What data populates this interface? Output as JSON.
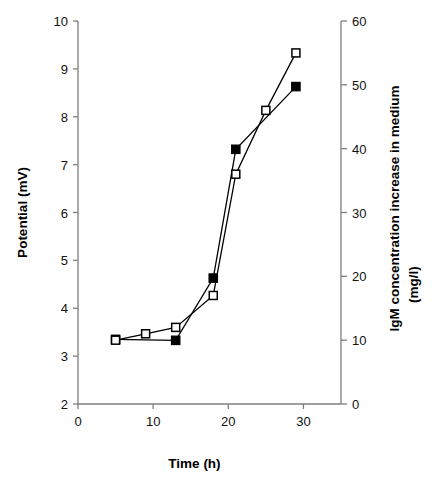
{
  "figure": {
    "background_color": "#ffffff",
    "line_color": "#000000",
    "axis_color": "#7f7f7f",
    "caption": ""
  },
  "chart_data": {
    "type": "line",
    "title": "",
    "xlabel": "Time (h)",
    "ylabel": "Potential (mV)",
    "y2label": "IgM concentration increase in medium (mg/l)",
    "y2label_line1": "IgM concentration increase in medium",
    "y2label_line2": "(mg/l)",
    "xlim": [
      0,
      35
    ],
    "ylim": [
      2,
      10
    ],
    "y2lim": [
      0,
      60
    ],
    "xticks": [
      0,
      10,
      20,
      30
    ],
    "xtick_labels": [
      "0",
      "10",
      "20",
      "30"
    ],
    "yticks": [
      2,
      3,
      4,
      5,
      6,
      7,
      8,
      9,
      10
    ],
    "ytick_labels": [
      "2",
      "3",
      "4",
      "5",
      "6",
      "7",
      "8",
      "9",
      "10"
    ],
    "y2ticks": [
      0,
      10,
      20,
      30,
      40,
      50,
      60
    ],
    "y2tick_labels": [
      "0",
      "10",
      "20",
      "30",
      "40",
      "50",
      "60"
    ],
    "grid": false,
    "legend": null,
    "series": [
      {
        "name": "Potential",
        "axis": "left",
        "marker": "filled-square",
        "unit": "mV",
        "x": [
          5,
          13,
          18,
          21,
          29
        ],
        "values": [
          3.35,
          3.33,
          4.63,
          7.32,
          8.63
        ]
      },
      {
        "name": "IgM concentration increase in medium",
        "axis": "right",
        "marker": "open-square",
        "unit": "mg/l",
        "x": [
          5,
          9,
          13,
          18,
          21,
          25,
          29
        ],
        "values": [
          10,
          11,
          12,
          17,
          36,
          46,
          55
        ]
      }
    ]
  }
}
